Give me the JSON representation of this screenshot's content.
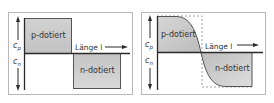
{
  "panels": [
    {
      "id": "abrupt-junction",
      "p_label": "p-dotiert",
      "n_label": "n-dotiert",
      "x_axis_label": "Länge l",
      "y_axis_upper": {
        "symbol": "c",
        "sub": "p"
      },
      "y_axis_lower": {
        "symbol": "c",
        "sub": "n"
      }
    },
    {
      "id": "graded-junction",
      "p_label": "p-dotiert",
      "n_label": "n-dotiert",
      "x_axis_label": "Länge l",
      "y_axis_upper": {
        "symbol": "c",
        "sub": "p"
      },
      "y_axis_lower": {
        "symbol": "c",
        "sub": "n"
      }
    }
  ],
  "colors": {
    "fill_light": "#e4e4e4",
    "fill_dark": "#bdbdbd",
    "axis": "#2a2a2a",
    "border": "#b8b8b8"
  }
}
